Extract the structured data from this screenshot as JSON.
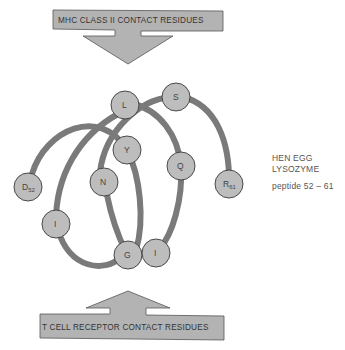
{
  "top_arrow": {
    "label": "MHC CLASS II CONTACT RESIDUES"
  },
  "bottom_arrow": {
    "label": "T CELL RECEPTOR CONTACT RESIDUES"
  },
  "side_text": {
    "line1": "HEN EGG",
    "line2": "LYSOZYME",
    "peptide": "peptide 52 – 61"
  },
  "colors": {
    "arrow_fill": "#b3b3b3",
    "arrow_stroke": "#555555",
    "tube": "#7a7a7a",
    "node_fill": "#bdbdbd",
    "node_stroke": "#3a3a3a"
  },
  "residues": [
    {
      "label": "D",
      "sub": "52",
      "x": 28,
      "y": 187
    },
    {
      "label": "Y",
      "sub": "",
      "x": 127,
      "y": 150
    },
    {
      "label": "I",
      "sub": "",
      "x": 56,
      "y": 224
    },
    {
      "label": "L",
      "sub": "",
      "x": 125,
      "y": 105
    },
    {
      "label": "N",
      "sub": "",
      "x": 104,
      "y": 182
    },
    {
      "label": "G",
      "sub": "",
      "x": 128,
      "y": 255
    },
    {
      "label": "S",
      "sub": "",
      "x": 176,
      "y": 97
    },
    {
      "label": "Q",
      "sub": "",
      "x": 181,
      "y": 166
    },
    {
      "label": "I",
      "sub": "",
      "x": 156,
      "y": 253
    },
    {
      "label": "R",
      "sub": "61",
      "x": 229,
      "y": 184
    }
  ]
}
